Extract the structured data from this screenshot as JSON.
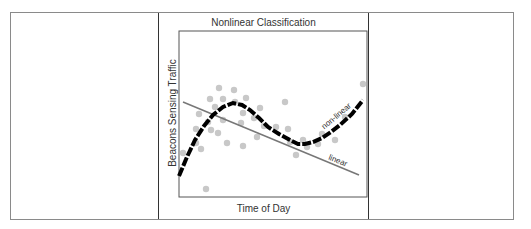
{
  "chart_data": {
    "type": "scatter",
    "title": "Nonlinear Classification",
    "xlabel": "Time of Day",
    "ylabel": "Beacons Sensing Traffic",
    "grid": false,
    "axis_ticks": false,
    "series": [
      {
        "name": "data points",
        "kind": "scatter",
        "color": "#c8c8c8",
        "points": [
          [
            183,
            153
          ],
          [
            196,
            129
          ],
          [
            199,
            114
          ],
          [
            201,
            149
          ],
          [
            196,
            143
          ],
          [
            206,
            189
          ],
          [
            208,
            122
          ],
          [
            210,
            99
          ],
          [
            211,
            130
          ],
          [
            215,
            107
          ],
          [
            218,
            133
          ],
          [
            219,
            88
          ],
          [
            223,
            99
          ],
          [
            223,
            120
          ],
          [
            227,
            143
          ],
          [
            234,
            90
          ],
          [
            235,
            102
          ],
          [
            241,
            123
          ],
          [
            243,
            113
          ],
          [
            243,
            146
          ],
          [
            246,
            98
          ],
          [
            254,
            118
          ],
          [
            257,
            137
          ],
          [
            260,
            108
          ],
          [
            264,
            126
          ],
          [
            276,
            127
          ],
          [
            285,
            102
          ],
          [
            288,
            129
          ],
          [
            290,
            142
          ],
          [
            296,
            155
          ],
          [
            303,
            140
          ],
          [
            307,
            147
          ],
          [
            318,
            144
          ],
          [
            322,
            134
          ],
          [
            335,
            140
          ],
          [
            345,
            117
          ],
          [
            363,
            84
          ]
        ]
      },
      {
        "name": "non-linear",
        "kind": "curve",
        "color": "#000000",
        "style": "dashed-thick",
        "points": [
          [
            179,
            176
          ],
          [
            187,
            157
          ],
          [
            195,
            140
          ],
          [
            204,
            126
          ],
          [
            213,
            115
          ],
          [
            223,
            107
          ],
          [
            233,
            103
          ],
          [
            242,
            105
          ],
          [
            250,
            110
          ],
          [
            259,
            118
          ],
          [
            268,
            127
          ],
          [
            279,
            134
          ],
          [
            290,
            140
          ],
          [
            298,
            144
          ],
          [
            305,
            144
          ],
          [
            313,
            142
          ],
          [
            322,
            138
          ],
          [
            331,
            132
          ],
          [
            340,
            125
          ],
          [
            352,
            114
          ],
          [
            363,
            100
          ]
        ]
      },
      {
        "name": "linear",
        "kind": "line",
        "color": "#777777",
        "points": [
          [
            183,
            102
          ],
          [
            359,
            175
          ]
        ]
      }
    ],
    "annotations": [
      {
        "text": "non-linear",
        "x": 338,
        "y": 118,
        "rotation": -40
      },
      {
        "text": "linear",
        "x": 337,
        "y": 163,
        "rotation": 22
      }
    ]
  },
  "layout": {
    "plot_box": {
      "left": 179,
      "top": 31,
      "right": 367,
      "bottom": 197
    }
  }
}
